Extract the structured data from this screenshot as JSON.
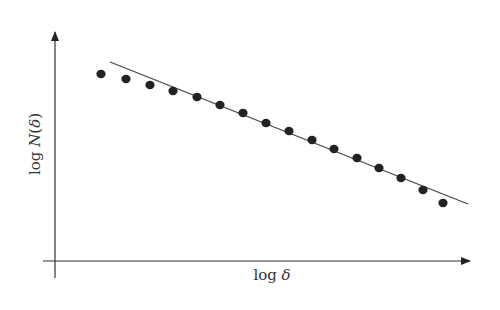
{
  "chart_data": {
    "type": "scatter",
    "title": "",
    "xlabel": "log δ",
    "ylabel": "log N(δ)",
    "xlabel_parts": {
      "func": "log ",
      "var": "δ"
    },
    "ylabel_parts": {
      "func": "log ",
      "var": "N",
      "open": "(",
      "arg": "δ",
      "close": ")"
    },
    "grid": false,
    "legend": null,
    "ticks": "none",
    "series": [
      {
        "name": "data points",
        "style": "filled-dots",
        "color": "#222222",
        "x": [
          1,
          2,
          3,
          4,
          5,
          6,
          7,
          8,
          9,
          10,
          11,
          12,
          13,
          14,
          15,
          16
        ],
        "y": [
          0.9,
          0.87,
          0.84,
          0.8,
          0.76,
          0.72,
          0.68,
          0.63,
          0.59,
          0.54,
          0.5,
          0.45,
          0.41,
          0.36,
          0.3,
          0.24
        ]
      },
      {
        "name": "fitted line",
        "style": "line",
        "color": "#444444",
        "x": [
          1.35,
          16.95
        ],
        "y": [
          0.96,
          0.28
        ]
      }
    ],
    "pixel_points": [
      [
        101,
        74
      ],
      [
        126,
        79
      ],
      [
        150,
        85
      ],
      [
        173,
        91
      ],
      [
        197,
        97
      ],
      [
        220,
        105
      ],
      [
        243,
        113
      ],
      [
        266,
        123
      ],
      [
        289,
        131
      ],
      [
        312,
        140
      ],
      [
        334,
        149
      ],
      [
        357,
        158
      ],
      [
        379,
        168
      ],
      [
        401,
        178
      ],
      [
        423,
        190
      ],
      [
        443,
        203
      ]
    ],
    "fit_line_pixels": {
      "x1": 110,
      "y1": 62,
      "x2": 468,
      "y2": 204
    }
  },
  "axes": {
    "color": "#333333",
    "x_axis": {
      "x1": 43,
      "x2": 470,
      "y": 261
    },
    "y_axis": {
      "x": 55,
      "y1": 278,
      "y2": 32
    }
  }
}
